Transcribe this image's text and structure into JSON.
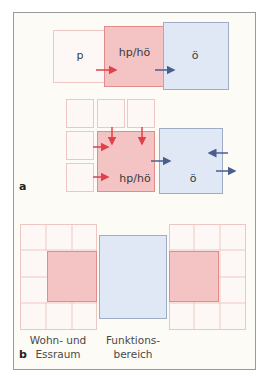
{
  "colors": {
    "frame_border": "#9a9a9a",
    "frame_bg": "#fdfbf6",
    "private_fill": "#fdf8f5",
    "private_border": "#efc7c2",
    "semi_fill": "#f4c3c3",
    "semi_border": "#e28b8b",
    "public_fill": "#dfe8f4",
    "public_border": "#9eacc6",
    "arrow_red": "#e0404a",
    "arrow_blue": "#4a5f8e"
  },
  "panel_a": {
    "label": "a",
    "top_row": {
      "private_label": "p",
      "semi_label": "hp/hö",
      "public_label": "ö"
    },
    "cluster": {
      "semi_label": "hp/hö",
      "public_label": "ö"
    }
  },
  "panel_b": {
    "label": "b",
    "caption_left_line1": "Wohn- und",
    "caption_left_line2": "Essraum",
    "caption_mid_line1": "Funktions-",
    "caption_mid_line2": "bereich"
  }
}
